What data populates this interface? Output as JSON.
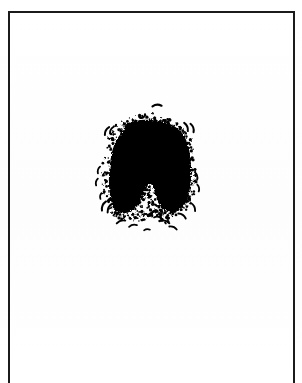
{
  "document": {
    "kind": "scanned-figure-plate",
    "page_background": "#ffffff",
    "ink_color": "#000000",
    "frame": {
      "border_color": "#1b1b1b",
      "border_width_px": 2,
      "left_px": 8,
      "top_px": 11,
      "right_px": 295,
      "bottom_edge": "cropped",
      "sides_visible": [
        "left",
        "top",
        "right"
      ]
    },
    "canvas": {
      "width_px": 302,
      "height_px": 373
    }
  },
  "figure": {
    "name": "inkblot",
    "bounds": {
      "x_px": 110,
      "y_px": 122,
      "width_px": 85,
      "height_px": 93
    },
    "fill": "#000000",
    "edge_texture": "stippled",
    "symmetry": "bilateral-approximate"
  },
  "satellite_marks": {
    "name": "scattered-dashes",
    "count": 24,
    "color": "#000000",
    "description": "small curved comma-like dashes surrounding the blot on left, right, above and below"
  },
  "chart_data": {
    "type": "scatter",
    "title": "",
    "xlabel": "",
    "ylabel": "",
    "grid": false,
    "legend": false,
    "blot_outline": [
      [
        132,
        122
      ],
      [
        141,
        120
      ],
      [
        151,
        120
      ],
      [
        161,
        121
      ],
      [
        170,
        124
      ],
      [
        178,
        129
      ],
      [
        184,
        136
      ],
      [
        188,
        145
      ],
      [
        190,
        155
      ],
      [
        191,
        166
      ],
      [
        191,
        177
      ],
      [
        190,
        188
      ],
      [
        188,
        197
      ],
      [
        185,
        204
      ],
      [
        180,
        209
      ],
      [
        174,
        212
      ],
      [
        168,
        212
      ],
      [
        163,
        209
      ],
      [
        159,
        204
      ],
      [
        156,
        197
      ],
      [
        154,
        190
      ],
      [
        152,
        185
      ],
      [
        149,
        184
      ],
      [
        146,
        187
      ],
      [
        144,
        193
      ],
      [
        141,
        200
      ],
      [
        137,
        206
      ],
      [
        132,
        210
      ],
      [
        126,
        213
      ],
      [
        120,
        213
      ],
      [
        115,
        210
      ],
      [
        112,
        204
      ],
      [
        110,
        196
      ],
      [
        109,
        186
      ],
      [
        109,
        175
      ],
      [
        110,
        164
      ],
      [
        112,
        152
      ],
      [
        116,
        141
      ],
      [
        122,
        132
      ],
      [
        127,
        126
      ],
      [
        132,
        122
      ]
    ],
    "dashes": [
      {
        "x": 157,
        "y": 106,
        "len": 9,
        "angle": -4,
        "w": 2.2
      },
      {
        "x": 186,
        "y": 127,
        "len": 9,
        "angle": 66,
        "w": 2.0
      },
      {
        "x": 192,
        "y": 128,
        "len": 9,
        "angle": 70,
        "w": 2.0
      },
      {
        "x": 107,
        "y": 131,
        "len": 9,
        "angle": -62,
        "w": 2.0
      },
      {
        "x": 112,
        "y": 130,
        "len": 8,
        "angle": -60,
        "w": 1.9
      },
      {
        "x": 99,
        "y": 170,
        "len": 7,
        "angle": -72,
        "w": 1.8
      },
      {
        "x": 97,
        "y": 182,
        "len": 7,
        "angle": -76,
        "w": 1.8
      },
      {
        "x": 196,
        "y": 176,
        "len": 8,
        "angle": 74,
        "w": 1.9
      },
      {
        "x": 198,
        "y": 188,
        "len": 7,
        "angle": 78,
        "w": 1.8
      },
      {
        "x": 104,
        "y": 206,
        "len": 10,
        "angle": -66,
        "w": 2.0
      },
      {
        "x": 110,
        "y": 208,
        "len": 10,
        "angle": -62,
        "w": 2.0
      },
      {
        "x": 193,
        "y": 207,
        "len": 9,
        "angle": 62,
        "w": 1.9
      },
      {
        "x": 121,
        "y": 222,
        "len": 9,
        "angle": -18,
        "w": 1.9
      },
      {
        "x": 133,
        "y": 226,
        "len": 8,
        "angle": -12,
        "w": 1.8
      },
      {
        "x": 158,
        "y": 218,
        "len": 8,
        "angle": 10,
        "w": 1.8
      },
      {
        "x": 165,
        "y": 222,
        "len": 9,
        "angle": 16,
        "w": 1.9
      },
      {
        "x": 173,
        "y": 228,
        "len": 8,
        "angle": 22,
        "w": 1.8
      },
      {
        "x": 182,
        "y": 216,
        "len": 9,
        "angle": 34,
        "w": 1.9
      },
      {
        "x": 150,
        "y": 215,
        "len": 5,
        "angle": 0,
        "w": 1.6
      },
      {
        "x": 116,
        "y": 214,
        "len": 6,
        "angle": -30,
        "w": 1.7
      },
      {
        "x": 189,
        "y": 198,
        "len": 6,
        "angle": 70,
        "w": 1.7
      },
      {
        "x": 101,
        "y": 196,
        "len": 6,
        "angle": -80,
        "w": 1.7
      },
      {
        "x": 147,
        "y": 230,
        "len": 6,
        "angle": -6,
        "w": 1.6
      },
      {
        "x": 176,
        "y": 208,
        "len": 6,
        "angle": 46,
        "w": 1.7
      }
    ],
    "speckles": [
      [
        113,
        134
      ],
      [
        118,
        128
      ],
      [
        124,
        124
      ],
      [
        130,
        121
      ],
      [
        137,
        118
      ],
      [
        145,
        117
      ],
      [
        153,
        117
      ],
      [
        162,
        119
      ],
      [
        170,
        122
      ],
      [
        177,
        127
      ],
      [
        183,
        133
      ],
      [
        187,
        141
      ],
      [
        190,
        150
      ],
      [
        192,
        161
      ],
      [
        193,
        172
      ],
      [
        193,
        183
      ],
      [
        191,
        193
      ],
      [
        188,
        201
      ],
      [
        184,
        207
      ],
      [
        178,
        212
      ],
      [
        171,
        215
      ],
      [
        164,
        213
      ],
      [
        158,
        208
      ],
      [
        154,
        201
      ],
      [
        151,
        194
      ],
      [
        148,
        189
      ],
      [
        145,
        191
      ],
      [
        143,
        197
      ],
      [
        140,
        204
      ],
      [
        136,
        210
      ],
      [
        130,
        215
      ],
      [
        123,
        217
      ],
      [
        117,
        215
      ],
      [
        112,
        210
      ],
      [
        108,
        202
      ],
      [
        106,
        193
      ],
      [
        105,
        183
      ],
      [
        105,
        172
      ],
      [
        106,
        161
      ],
      [
        108,
        149
      ],
      [
        110,
        140
      ],
      [
        150,
        205
      ],
      [
        152,
        210
      ],
      [
        148,
        212
      ],
      [
        155,
        213
      ],
      [
        145,
        214
      ],
      [
        159,
        215
      ],
      [
        141,
        217
      ],
      [
        163,
        218
      ],
      [
        137,
        219
      ],
      [
        167,
        220
      ]
    ]
  }
}
